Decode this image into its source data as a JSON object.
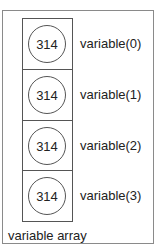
{
  "diagram": {
    "caption": "variable array",
    "elements": [
      {
        "value": "314",
        "label": "variable(0)"
      },
      {
        "value": "314",
        "label": "variable(1)"
      },
      {
        "value": "314",
        "label": "variable(2)"
      },
      {
        "value": "314",
        "label": "variable(3)"
      }
    ]
  }
}
